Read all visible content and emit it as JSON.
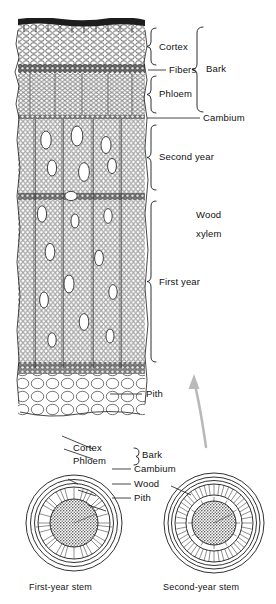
{
  "figure": {
    "line_color": "#1a1a1a",
    "arrow_color": "#b9b9b9",
    "background": "#ffffff"
  },
  "stem_labels": [
    {
      "id": "cortex",
      "text": "Cortex",
      "marker": "brace"
    },
    {
      "id": "fibers",
      "text": "Fibers",
      "marker": "leader"
    },
    {
      "id": "phloem",
      "text": "Phloem",
      "marker": "brace"
    },
    {
      "id": "bark",
      "text": "Bark",
      "marker": "brace"
    },
    {
      "id": "cambium",
      "text": "Cambium",
      "marker": "leader"
    },
    {
      "id": "second-year",
      "text": "Second year",
      "marker": "brace"
    },
    {
      "id": "wood",
      "text": "Wood",
      "marker": "none"
    },
    {
      "id": "xylem",
      "text": "xylem",
      "marker": "none"
    },
    {
      "id": "first-year",
      "text": "First year",
      "marker": "brace"
    },
    {
      "id": "pith",
      "text": "Pith",
      "marker": "leader"
    }
  ],
  "cross_section_labels": [
    {
      "id": "cs-cortex",
      "text": "Cortex"
    },
    {
      "id": "cs-phloem",
      "text": "Phloem"
    },
    {
      "id": "cs-bark",
      "text": "Bark"
    },
    {
      "id": "cs-cambium",
      "text": "Cambium"
    },
    {
      "id": "cs-wood",
      "text": "Wood"
    },
    {
      "id": "cs-pith",
      "text": "Pith"
    }
  ],
  "captions": {
    "first_year_stem": "First-year stem",
    "second_year_stem": "Second-year stem"
  },
  "zones": {
    "epidermis": "epidermis",
    "cortex": "cortex",
    "fiber_band": "fiber band",
    "phloem": "phloem",
    "cambium": "cambium",
    "second_year_xylem": "second year xylem",
    "first_year_xylem": "first year xylem",
    "pith": "pith"
  }
}
